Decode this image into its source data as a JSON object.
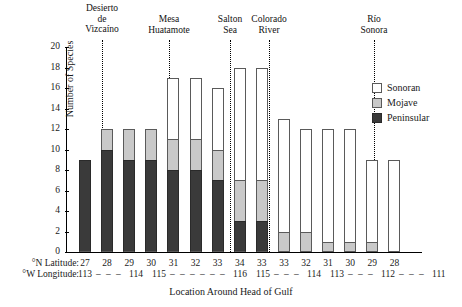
{
  "chart_data": {
    "type": "bar",
    "subtype": "stacked",
    "title": "",
    "xlabel": "Location Around Head of Gulf",
    "ylabel": "Number of Species",
    "ylim": [
      0,
      20
    ],
    "yticks": [
      0,
      2,
      4,
      6,
      8,
      10,
      12,
      14,
      16,
      18,
      20
    ],
    "grid": false,
    "legend_position": "right",
    "categories": [
      "27",
      "28",
      "29",
      "30",
      "31",
      "32",
      "33",
      "34",
      "33",
      "33",
      "32",
      "31",
      "30",
      "29",
      "28"
    ],
    "axis_labels": {
      "latitude_key": "°N Latitude:",
      "longitude_key": "°W Longitude:",
      "latitude_values": [
        "27",
        "28",
        "29",
        "30",
        "31",
        "32",
        "33",
        "34",
        "33",
        "33",
        "32",
        "31",
        "30",
        "29",
        "28"
      ],
      "longitude_row": "113 – – – 114  115 – – – – – – 116  115 – – – 114  113 – – – 112 – – – 111"
    },
    "series": [
      {
        "name": "Peninsular",
        "color": "#3a3a3a",
        "values": [
          9,
          10,
          9,
          9,
          8,
          8,
          7,
          3,
          3,
          0,
          0,
          0,
          0,
          0,
          0
        ]
      },
      {
        "name": "Mojave",
        "color": "#c9c9c9",
        "values": [
          0,
          2,
          3,
          3,
          3,
          3,
          3,
          4,
          4,
          2,
          2,
          1,
          1,
          1,
          0
        ]
      },
      {
        "name": "Sonoran",
        "color": "#ffffff",
        "values": [
          0,
          0,
          0,
          0,
          6,
          6,
          6,
          11,
          11,
          11,
          10,
          11,
          11,
          8,
          9
        ]
      }
    ],
    "totals": [
      9,
      12,
      12,
      12,
      17,
      17,
      16,
      18,
      18,
      13,
      12,
      12,
      12,
      9,
      9
    ],
    "legend": [
      {
        "label": "Sonoran",
        "swatch": "son"
      },
      {
        "label": "Mojave",
        "swatch": "moj"
      },
      {
        "label": "Peninsular",
        "swatch": "pen"
      }
    ],
    "regions": [
      {
        "label": "Desierto\nde\nVizcaíno",
        "center_x": 102
      },
      {
        "label": "Mesa\nHuatamote",
        "center_x": 169
      },
      {
        "label": "Salton\nSea",
        "center_x": 230
      },
      {
        "label": "Colorado\nRiver",
        "center_x": 269
      },
      {
        "label": "Río\nSonora",
        "center_x": 374
      }
    ],
    "dividers_x": [
      102,
      169,
      230,
      269,
      374
    ],
    "longitude_ticks": [
      {
        "text": "113",
        "x": 78
      },
      {
        "text": "–",
        "x": 96
      },
      {
        "text": "–",
        "x": 106
      },
      {
        "text": "–",
        "x": 116
      },
      {
        "text": "114",
        "x": 129
      },
      {
        "text": "115",
        "x": 152
      },
      {
        "text": "–",
        "x": 170
      },
      {
        "text": "–",
        "x": 180
      },
      {
        "text": "–",
        "x": 190
      },
      {
        "text": "–",
        "x": 200
      },
      {
        "text": "–",
        "x": 210
      },
      {
        "text": "–",
        "x": 220
      },
      {
        "text": "116",
        "x": 233
      },
      {
        "text": "115",
        "x": 256
      },
      {
        "text": "–",
        "x": 274
      },
      {
        "text": "–",
        "x": 284
      },
      {
        "text": "–",
        "x": 294
      },
      {
        "text": "114",
        "x": 307
      },
      {
        "text": "113",
        "x": 330
      },
      {
        "text": "–",
        "x": 348
      },
      {
        "text": "–",
        "x": 358
      },
      {
        "text": "–",
        "x": 368
      },
      {
        "text": "112",
        "x": 381
      },
      {
        "text": "–",
        "x": 399
      },
      {
        "text": "–",
        "x": 409
      },
      {
        "text": "–",
        "x": 419
      },
      {
        "text": "111",
        "x": 432
      }
    ]
  }
}
